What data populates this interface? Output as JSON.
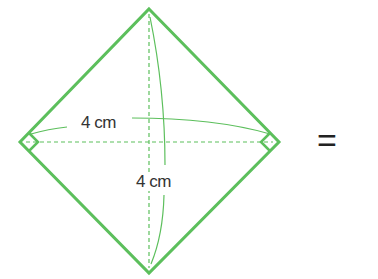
{
  "figure": {
    "shape": "rhombus (square rotated 45°) with perpendicular diagonals",
    "stroke_color": "#5cbf5c",
    "diagonal_horizontal": {
      "label": "4 cm"
    },
    "diagonal_vertical": {
      "label": "4 cm"
    },
    "right_angle_marks": 2,
    "operator": "="
  }
}
